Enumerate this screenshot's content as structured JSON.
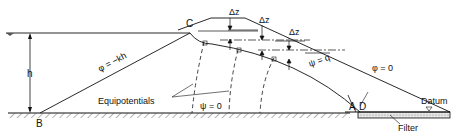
{
  "labels": {
    "point_c": "C",
    "point_b": "B",
    "point_a": "A",
    "point_d": "D",
    "height": "h",
    "delta_z_1": "Δz",
    "delta_z_2": "Δz",
    "delta_z_3": "Δz",
    "phi_upstream": "φ = −kh",
    "psi_top": "ψ = q",
    "phi_zero": "φ = 0",
    "psi_zero": "ψ = 0",
    "equipotentials": "Equipotentials",
    "datum": "Datum",
    "filter": "Filter"
  },
  "colors": {
    "line": "#111111",
    "background": "#ffffff",
    "filter_fill": "#dcdcdc"
  }
}
